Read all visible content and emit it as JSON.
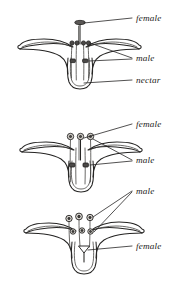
{
  "figure": {
    "background_color": "#ffffff",
    "ink_color": "#262524",
    "panels": [
      {
        "id": "panel-1",
        "name": "long-styled-flower",
        "labels": [
          {
            "id": "label-female-1",
            "text": "female",
            "x": 136,
            "y": 21
          },
          {
            "id": "label-male-1",
            "text": "male",
            "x": 136,
            "y": 61
          },
          {
            "id": "label-nectar-1",
            "text": "nectar",
            "x": 136,
            "y": 83
          }
        ],
        "parts": {
          "style_count": 1,
          "anther_count": 4,
          "petal_count": 2
        }
      },
      {
        "id": "panel-2",
        "name": "mid-styled-flower",
        "labels": [
          {
            "id": "label-female-2",
            "text": "female",
            "x": 136,
            "y": 127
          },
          {
            "id": "label-male-2",
            "text": "male",
            "x": 136,
            "y": 163
          }
        ],
        "parts": {
          "style_count": 1,
          "anther_count": 6,
          "petal_count": 2
        }
      },
      {
        "id": "panel-3",
        "name": "short-styled-flower",
        "labels": [
          {
            "id": "label-male-3",
            "text": "male",
            "x": 136,
            "y": 194
          },
          {
            "id": "label-female-3",
            "text": "female",
            "x": 136,
            "y": 249
          }
        ],
        "parts": {
          "style_count": 1,
          "anther_count": 6,
          "petal_count": 2
        }
      }
    ]
  }
}
